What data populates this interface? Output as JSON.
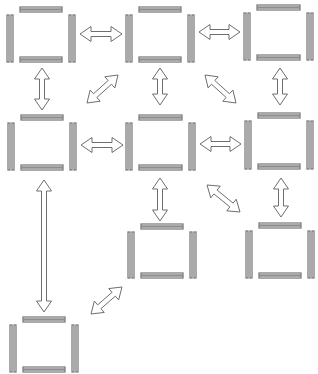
{
  "diagram": {
    "type": "grid-network",
    "colors": {
      "background": "#ffffff",
      "stroke": "#7d7d7d",
      "arrow_stroke": "#6e6e6e"
    },
    "nodes": [
      {
        "id": "n1",
        "row": 1,
        "col": 1,
        "x": 7,
        "y": 7,
        "w": 68,
        "h": 55
      },
      {
        "id": "n2",
        "row": 1,
        "col": 2,
        "x": 126,
        "y": 7,
        "w": 68,
        "h": 55
      },
      {
        "id": "n3",
        "row": 1,
        "col": 3,
        "x": 244,
        "y": 5,
        "w": 69,
        "h": 55
      },
      {
        "id": "n4",
        "row": 2,
        "col": 1,
        "x": 8,
        "y": 115,
        "w": 68,
        "h": 55
      },
      {
        "id": "n5",
        "row": 2,
        "col": 2,
        "x": 126,
        "y": 115,
        "w": 69,
        "h": 55
      },
      {
        "id": "n6",
        "row": 2,
        "col": 3,
        "x": 245,
        "y": 113,
        "w": 68,
        "h": 56
      },
      {
        "id": "n7",
        "row": 3,
        "col": 2,
        "x": 128,
        "y": 224,
        "w": 68,
        "h": 54
      },
      {
        "id": "n8",
        "row": 3,
        "col": 3,
        "x": 246,
        "y": 223,
        "w": 68,
        "h": 55
      },
      {
        "id": "n9",
        "row": 4,
        "col": 1,
        "x": 10,
        "y": 317,
        "w": 68,
        "h": 55
      }
    ],
    "edges": [
      {
        "from": "n1",
        "to": "n2",
        "kind": "horizontal",
        "x1": 80,
        "y1": 34,
        "x2": 122,
        "y2": 34
      },
      {
        "from": "n2",
        "to": "n3",
        "kind": "horizontal",
        "x1": 199,
        "y1": 32,
        "x2": 240,
        "y2": 32
      },
      {
        "from": "n1",
        "to": "n4",
        "kind": "vertical",
        "x1": 42,
        "y1": 68,
        "x2": 42,
        "y2": 110
      },
      {
        "from": "n4",
        "to": "n2",
        "kind": "diagonal",
        "x1": 87,
        "y1": 103,
        "x2": 118,
        "y2": 75
      },
      {
        "from": "n2",
        "to": "n5",
        "kind": "vertical",
        "x1": 160,
        "y1": 68,
        "x2": 160,
        "y2": 105
      },
      {
        "from": "n2",
        "to": "n6",
        "kind": "diagonal",
        "x1": 205,
        "y1": 75,
        "x2": 236,
        "y2": 103
      },
      {
        "from": "n3",
        "to": "n6",
        "kind": "vertical",
        "x1": 280,
        "y1": 68,
        "x2": 280,
        "y2": 105
      },
      {
        "from": "n4",
        "to": "n5",
        "kind": "horizontal",
        "x1": 81,
        "y1": 145,
        "x2": 123,
        "y2": 145
      },
      {
        "from": "n5",
        "to": "n6",
        "kind": "horizontal",
        "x1": 200,
        "y1": 144,
        "x2": 241,
        "y2": 144
      },
      {
        "from": "n4",
        "to": "n9",
        "kind": "vertical",
        "x1": 44,
        "y1": 180,
        "x2": 44,
        "y2": 312
      },
      {
        "from": "n5",
        "to": "n7",
        "kind": "vertical",
        "x1": 160,
        "y1": 178,
        "x2": 160,
        "y2": 221
      },
      {
        "from": "n5",
        "to": "n8",
        "kind": "diagonal",
        "x1": 207,
        "y1": 185,
        "x2": 240,
        "y2": 212
      },
      {
        "from": "n6",
        "to": "n8",
        "kind": "vertical",
        "x1": 281,
        "y1": 178,
        "x2": 281,
        "y2": 217
      },
      {
        "from": "n9",
        "to": "n7",
        "kind": "diagonal",
        "x1": 91,
        "y1": 314,
        "x2": 122,
        "y2": 287
      }
    ]
  }
}
